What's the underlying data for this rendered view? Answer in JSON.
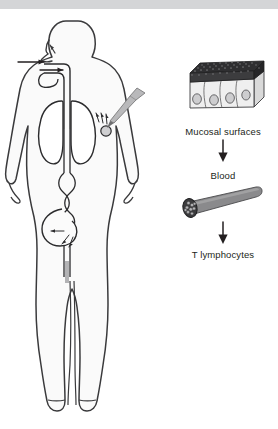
{
  "figure": {
    "caption_absent": true
  },
  "colors": {
    "top_band": "#d4d5d7",
    "page_background": "#ffffff",
    "outline": "#3a3a3c",
    "body_fill": "#fafafa",
    "organ_outline": "#2b2b2d",
    "microvilli_dark": "#2f2f31",
    "epithelium_fill": "#efefef",
    "epithelium_side_fill": "#d9d9d9",
    "vessel_fill": "#8a8a8c",
    "vessel_dark": "#3b3b3d",
    "arrow_black": "#231f20",
    "needle_fill": "#b9b9bb",
    "text": "#231f20"
  },
  "body_panel": {
    "name": "human-body-silhouette",
    "annotations": {
      "nose_arrow": "nasal-inhalation-arrow",
      "mouth_arrows": [
        "oral-intake-arrow-upper",
        "oral-intake-arrow-lower"
      ],
      "injection": "needle-injection-shoulder",
      "organs": [
        "lungs",
        "esophagus",
        "trachea",
        "stomach",
        "intestine",
        "rectum"
      ]
    }
  },
  "flow_panel": {
    "steps": [
      {
        "id": "mucosa",
        "label": "Mucosal surfaces",
        "icon": "epithelium-block-icon"
      },
      {
        "id": "blood",
        "label": "Blood",
        "icon": "blood-vessel-icon"
      },
      {
        "id": "tcells",
        "label": "T lymphocytes",
        "icon": "none"
      }
    ],
    "arrows": [
      {
        "id": "arrow-mucosa-to-blood",
        "direction": "down"
      },
      {
        "id": "arrow-blood-to-tcells",
        "direction": "down"
      }
    ]
  }
}
